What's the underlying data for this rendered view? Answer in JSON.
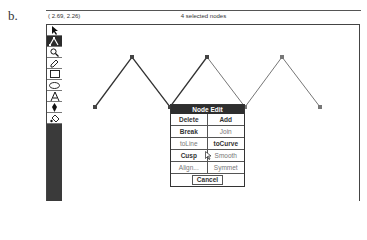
{
  "figure_label": "b.",
  "status_bar": {
    "coordinates": "( 2.69,  2.26)",
    "message": "4 selected nodes"
  },
  "toolbox": {
    "tools": [
      {
        "name": "pick-tool",
        "icon": "arrow-pointer-icon",
        "active": false
      },
      {
        "name": "shape-tool",
        "icon": "node-edit-icon",
        "active": true
      },
      {
        "name": "zoom-tool",
        "icon": "magnifier-icon",
        "active": false
      },
      {
        "name": "pencil-tool",
        "icon": "pencil-icon",
        "active": false
      },
      {
        "name": "rectangle-tool",
        "icon": "rectangle-icon",
        "active": false
      },
      {
        "name": "ellipse-tool",
        "icon": "ellipse-icon",
        "active": false
      },
      {
        "name": "text-tool",
        "icon": "text-a-icon",
        "active": false
      },
      {
        "name": "outline-tool",
        "icon": "pen-nib-icon",
        "active": false
      },
      {
        "name": "fill-tool",
        "icon": "paint-bucket-icon",
        "active": false
      }
    ]
  },
  "drawing": {
    "nodes": [
      [
        95,
        107
      ],
      [
        132,
        57
      ],
      [
        170,
        107
      ],
      [
        207,
        57
      ],
      [
        245,
        107
      ],
      [
        282,
        57
      ],
      [
        320,
        107
      ]
    ],
    "selected_nodes": 4
  },
  "node_edit_dialog": {
    "title": "Node Edit",
    "buttons": [
      {
        "label": "Delete",
        "enabled": true
      },
      {
        "label": "Add",
        "enabled": true
      },
      {
        "label": "Break",
        "enabled": true
      },
      {
        "label": "Join",
        "enabled": false
      },
      {
        "label": "toLine",
        "enabled": false
      },
      {
        "label": "toCurve",
        "enabled": true
      },
      {
        "label": "Cusp",
        "enabled": true
      },
      {
        "label": "Smooth",
        "enabled": false
      },
      {
        "label": "Align...",
        "enabled": false
      },
      {
        "label": "Symmet",
        "enabled": false
      }
    ],
    "cancel_label": "Cancel"
  }
}
